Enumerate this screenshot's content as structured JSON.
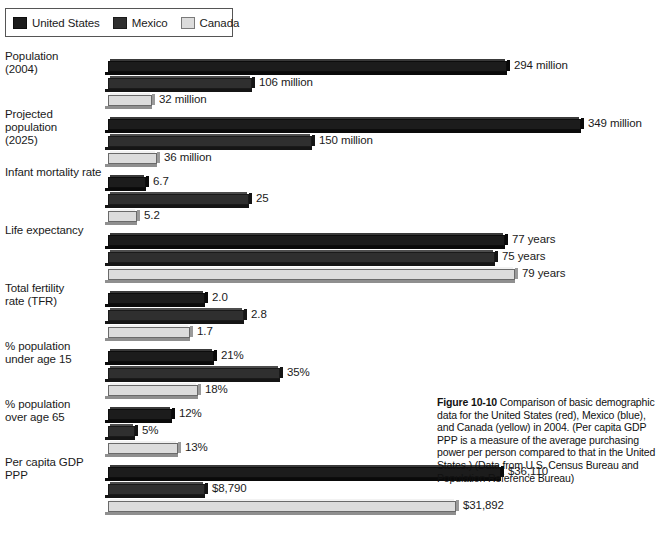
{
  "legend": {
    "items": [
      {
        "key": "us",
        "label": "United States",
        "swatch": "legend-swatch-united-states"
      },
      {
        "key": "mx",
        "label": "Mexico",
        "swatch": "legend-swatch-mexico"
      },
      {
        "key": "ca",
        "label": "Canada",
        "swatch": "legend-swatch-canada"
      }
    ]
  },
  "caption": {
    "figure_number": "Figure 10-10",
    "text": " Comparison of basic demographic data for the United States (red), Mexico (blue), and Canada (yellow) in 2004. (Per capita GDP PPP is a measure of the average purchasing power per person compared to that in the United States.) (Data from U.S. Census Bureau and Population Reference Bureau)"
  },
  "chart_data": {
    "type": "bar",
    "orientation": "horizontal",
    "title": "",
    "xlabel": "",
    "ylabel": "",
    "grid": false,
    "legend_position": "top-left",
    "series": [
      {
        "name": "United States",
        "key": "us",
        "color": "#1c1c1c"
      },
      {
        "name": "Mexico",
        "key": "mx",
        "color": "#2f2f2f"
      },
      {
        "name": "Canada",
        "key": "ca",
        "color": "#dcdcdc"
      }
    ],
    "categories": [
      "Population (2004)",
      "Projected population (2025)",
      "Infant mortality rate",
      "Life expectancy",
      "Total fertility rate (TFR)",
      "% population under age 15",
      "% population over age 65",
      "Per capita GDP PPP"
    ],
    "groups": [
      {
        "label_line1": "Population",
        "label_line2": "(2004)",
        "top": 5,
        "bars": [
          {
            "series": "us",
            "value": 294,
            "display": "294 million",
            "length": 399,
            "top": 9
          },
          {
            "series": "mx",
            "value": 106,
            "display": "106 million",
            "length": 144,
            "top": 26
          },
          {
            "series": "ca",
            "value": 32,
            "display": "32 million",
            "length": 44,
            "top": 43
          }
        ]
      },
      {
        "label_line1": "Projected population",
        "label_line2": "(2025)",
        "top": 63,
        "bars": [
          {
            "series": "us",
            "value": 349,
            "display": "349 million",
            "length": 473,
            "top": 9
          },
          {
            "series": "mx",
            "value": 150,
            "display": "150 million",
            "length": 204,
            "top": 26
          },
          {
            "series": "ca",
            "value": 36,
            "display": "36 million",
            "length": 49,
            "top": 43
          }
        ]
      },
      {
        "label_line1": "Infant mortality rate",
        "label_line2": "",
        "top": 121,
        "bars": [
          {
            "series": "us",
            "value": 6.7,
            "display": "6.7",
            "length": 38,
            "top": 9
          },
          {
            "series": "mx",
            "value": 25,
            "display": "25",
            "length": 141,
            "top": 26
          },
          {
            "series": "ca",
            "value": 5.2,
            "display": "5.2",
            "length": 29,
            "top": 43
          }
        ]
      },
      {
        "label_line1": "Life expectancy",
        "label_line2": "",
        "top": 179,
        "bars": [
          {
            "series": "us",
            "value": 77,
            "display": "77 years",
            "length": 397,
            "top": 9
          },
          {
            "series": "mx",
            "value": 75,
            "display": "75 years",
            "length": 387,
            "top": 26
          },
          {
            "series": "ca",
            "value": 79,
            "display": "79 years",
            "length": 407,
            "top": 43
          }
        ]
      },
      {
        "label_line1": "Total fertility",
        "label_line2": "rate (TFR)",
        "top": 237,
        "bars": [
          {
            "series": "us",
            "value": 2.0,
            "display": "2.0",
            "length": 97,
            "top": 9
          },
          {
            "series": "mx",
            "value": 2.8,
            "display": "2.8",
            "length": 136,
            "top": 26
          },
          {
            "series": "ca",
            "value": 1.7,
            "display": "1.7",
            "length": 82,
            "top": 43
          }
        ]
      },
      {
        "label_line1": "% population",
        "label_line2": "under age 15",
        "top": 295,
        "bars": [
          {
            "series": "us",
            "value": 21,
            "display": "21%",
            "length": 106,
            "top": 9
          },
          {
            "series": "mx",
            "value": 35,
            "display": "35%",
            "length": 172,
            "top": 26
          },
          {
            "series": "ca",
            "value": 18,
            "display": "18%",
            "length": 90,
            "top": 43
          }
        ]
      },
      {
        "label_line1": "% population",
        "label_line2": "over age 65",
        "top": 353,
        "bars": [
          {
            "series": "us",
            "value": 12,
            "display": "12%",
            "length": 64,
            "top": 9
          },
          {
            "series": "mx",
            "value": 5,
            "display": "5%",
            "length": 27,
            "top": 26
          },
          {
            "series": "ca",
            "value": 13,
            "display": "13%",
            "length": 70,
            "top": 43
          }
        ]
      },
      {
        "label_line1": "Per capita GDP PPP",
        "label_line2": "",
        "top": 411,
        "bars": [
          {
            "series": "us",
            "value": 36110,
            "display": "$36,110",
            "length": 393,
            "top": 9
          },
          {
            "series": "mx",
            "value": 8790,
            "display": "$8,790",
            "length": 97,
            "top": 26
          },
          {
            "series": "ca",
            "value": 31892,
            "display": "$31,892",
            "length": 348,
            "top": 43
          }
        ]
      }
    ]
  }
}
